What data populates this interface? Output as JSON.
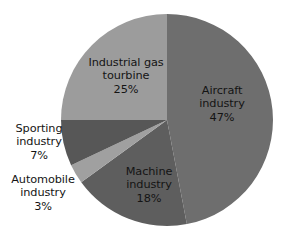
{
  "chart_data": {
    "type": "pie",
    "title": "",
    "subtitle": "",
    "xlabel": "",
    "ylabel": "",
    "legend": "none",
    "grid": false,
    "start_angle_deg": 0,
    "direction": "clockwise",
    "categories": [
      "Aircraft industry",
      "Machine industry",
      "Automobile industry",
      "Sporting industry",
      "Industrial gas tourbine"
    ],
    "values": [
      47,
      18,
      3,
      7,
      25
    ],
    "value_unit": "%",
    "colors": [
      "#6e6e6e",
      "#5e5e5e",
      "#a0a0a0",
      "#575757",
      "#9c9c9c"
    ],
    "slices": [
      {
        "name": "Aircraft industry",
        "value": 47,
        "label_line1": "Aircraft",
        "label_line2": "industry",
        "label_value": "47%",
        "color": "#6e6e6e",
        "label_placement": "inside"
      },
      {
        "name": "Machine industry",
        "value": 18,
        "label_line1": "Machine",
        "label_line2": "industry",
        "label_value": "18%",
        "color": "#5e5e5e",
        "label_placement": "inside"
      },
      {
        "name": "Automobile industry",
        "value": 3,
        "label_line1": "Automobile",
        "label_line2": "industry",
        "label_value": "3%",
        "color": "#a0a0a0",
        "label_placement": "outside"
      },
      {
        "name": "Sporting industry",
        "value": 7,
        "label_line1": "Sporting",
        "label_line2": "industry",
        "label_value": "7%",
        "color": "#575757",
        "label_placement": "outside"
      },
      {
        "name": "Industrial gas tourbine",
        "value": 25,
        "label_line1": "Industrial gas",
        "label_line2": "tourbine",
        "label_value": "25%",
        "color": "#9c9c9c",
        "label_placement": "inside"
      }
    ]
  },
  "geometry": {
    "center_x": 167,
    "center_y": 120,
    "radius": 106
  },
  "background_color": "#ffffff",
  "text_color": "#141414"
}
